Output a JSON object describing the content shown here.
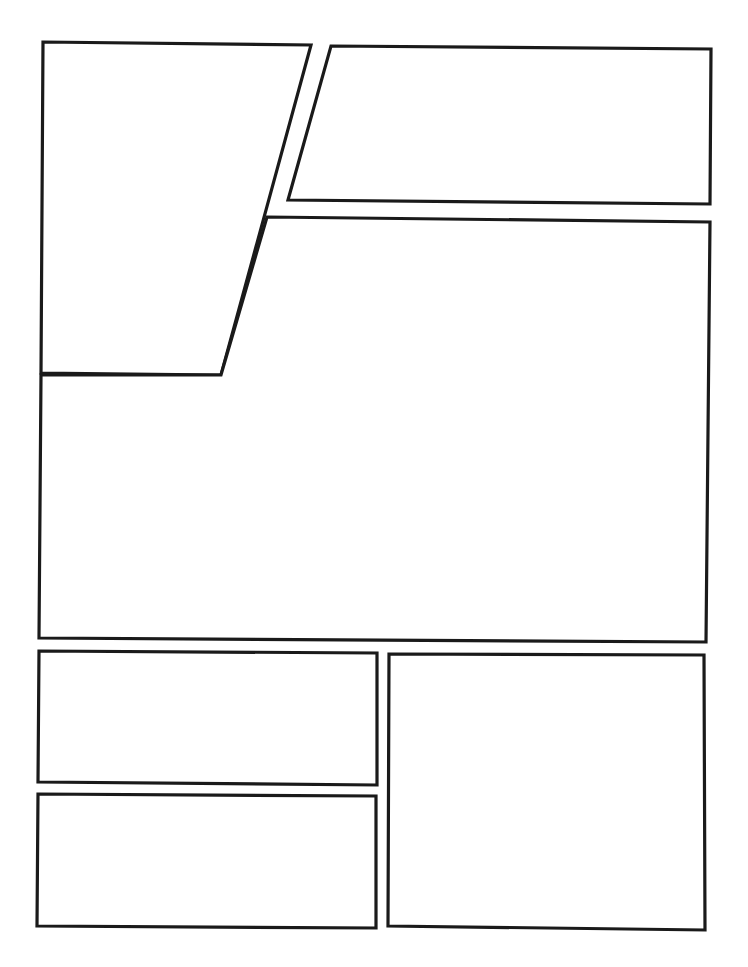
{
  "page": {
    "width": 748,
    "height": 967,
    "background": "#ffffff",
    "border_color": "#1a1a1a"
  },
  "panels": [
    {
      "id": "panel-1",
      "shape": "trapezoid",
      "points": "43,42 311,45 221,375 41,373"
    },
    {
      "id": "panel-2",
      "shape": "trapezoid",
      "points": "331,46 711,49 710,204 288,200"
    },
    {
      "id": "panel-3",
      "shape": "l-shape",
      "points": "267,217 710,222 706,642 39,638 41,375 221,375"
    },
    {
      "id": "panel-4",
      "shape": "rect",
      "points": "39,651 377,653 377,785 38,782"
    },
    {
      "id": "panel-5",
      "shape": "rect",
      "points": "38,794 376,796 376,928 37,926"
    },
    {
      "id": "panel-6",
      "shape": "rect",
      "points": "389,654 704,655 705,930 388,926"
    }
  ]
}
